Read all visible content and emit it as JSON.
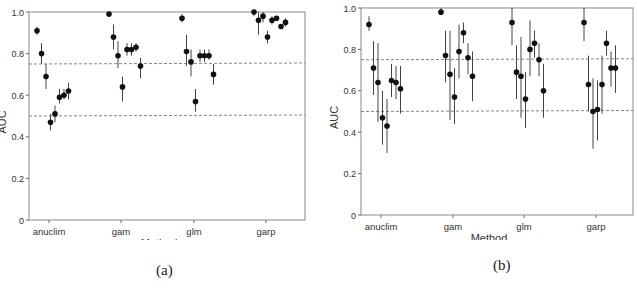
{
  "chart_data": [
    {
      "id": "a",
      "type": "scatter",
      "subtype": "point-with-error-bars",
      "caption": "(a)",
      "title": "",
      "xlabel": "Method",
      "ylabel": "AUC",
      "ylim": [
        0,
        1.0
      ],
      "yticks": [
        "0",
        "0.2",
        "0.4",
        "0.6",
        "0.8",
        "1.0"
      ],
      "categories": [
        "anuclim",
        "gam",
        "glm",
        "garp"
      ],
      "reference_lines": [
        0.5,
        0.75
      ],
      "grid": false,
      "legend": null,
      "series": [
        {
          "name": "anuclim",
          "values": [
            0.91,
            0.8,
            0.69,
            0.47,
            0.51,
            0.59,
            0.6,
            0.62
          ],
          "lower": [
            0.89,
            0.75,
            0.63,
            0.43,
            0.47,
            0.56,
            0.58,
            0.58
          ],
          "upper": [
            0.93,
            0.85,
            0.75,
            0.51,
            0.55,
            0.63,
            0.63,
            0.66
          ]
        },
        {
          "name": "gam",
          "values": [
            0.99,
            0.88,
            0.79,
            0.64,
            0.82,
            0.82,
            0.83,
            0.74
          ],
          "lower": [
            0.98,
            0.82,
            0.73,
            0.57,
            0.79,
            0.79,
            0.81,
            0.68
          ],
          "upper": [
            1.0,
            0.94,
            0.86,
            0.69,
            0.85,
            0.85,
            0.85,
            0.78
          ]
        },
        {
          "name": "glm",
          "values": [
            0.97,
            0.81,
            0.76,
            0.57,
            0.79,
            0.79,
            0.79,
            0.7
          ],
          "lower": [
            0.95,
            0.74,
            0.69,
            0.52,
            0.76,
            0.76,
            0.77,
            0.65
          ],
          "upper": [
            0.99,
            0.89,
            0.82,
            0.63,
            0.82,
            0.82,
            0.82,
            0.75
          ]
        },
        {
          "name": "garp",
          "values": [
            1.0,
            0.96,
            0.98,
            0.88,
            0.96,
            0.97,
            0.93,
            0.95
          ],
          "lower": [
            0.98,
            0.89,
            0.95,
            0.85,
            0.94,
            0.96,
            0.92,
            0.93
          ],
          "upper": [
            1.0,
            1.0,
            1.0,
            0.91,
            0.98,
            0.98,
            0.94,
            0.97
          ]
        }
      ]
    },
    {
      "id": "b",
      "type": "scatter",
      "subtype": "point-with-error-bars",
      "caption": "(b)",
      "title": "",
      "xlabel": "Method",
      "ylabel": "AUC",
      "ylim": [
        0,
        1.0
      ],
      "yticks": [
        "0",
        "0.2",
        "0.4",
        "0.6",
        "0.8",
        "1.0"
      ],
      "categories": [
        "anuclim",
        "gam",
        "glm",
        "garp"
      ],
      "reference_lines": [
        0.5,
        0.75
      ],
      "grid": false,
      "legend": null,
      "series": [
        {
          "name": "anuclim",
          "values": [
            0.92,
            0.71,
            0.64,
            0.47,
            0.43,
            0.65,
            0.64,
            0.61
          ],
          "lower": [
            0.89,
            0.58,
            0.45,
            0.34,
            0.3,
            0.57,
            0.56,
            0.49
          ],
          "upper": [
            0.96,
            0.84,
            0.83,
            0.6,
            0.56,
            0.73,
            0.72,
            0.72
          ]
        },
        {
          "name": "gam",
          "values": [
            0.98,
            0.77,
            0.68,
            0.57,
            0.79,
            0.88,
            0.76,
            0.67
          ],
          "lower": [
            0.97,
            0.64,
            0.46,
            0.44,
            0.66,
            0.83,
            0.68,
            0.55
          ],
          "upper": [
            1.0,
            0.89,
            0.89,
            0.71,
            0.92,
            0.93,
            0.83,
            0.79
          ]
        },
        {
          "name": "glm",
          "values": [
            0.93,
            0.69,
            0.67,
            0.56,
            0.8,
            0.83,
            0.75,
            0.6
          ],
          "lower": [
            0.82,
            0.56,
            0.47,
            0.42,
            0.67,
            0.76,
            0.67,
            0.47
          ],
          "upper": [
            1.0,
            0.82,
            0.86,
            0.69,
            0.94,
            0.89,
            0.83,
            0.73
          ]
        },
        {
          "name": "garp",
          "values": [
            0.93,
            0.63,
            0.5,
            0.51,
            0.63,
            0.83,
            0.71,
            0.71
          ],
          "lower": [
            0.84,
            0.5,
            0.32,
            0.36,
            0.49,
            0.77,
            0.62,
            0.59
          ],
          "upper": [
            1.0,
            0.77,
            0.66,
            0.65,
            0.77,
            0.89,
            0.79,
            0.82
          ]
        }
      ]
    }
  ]
}
